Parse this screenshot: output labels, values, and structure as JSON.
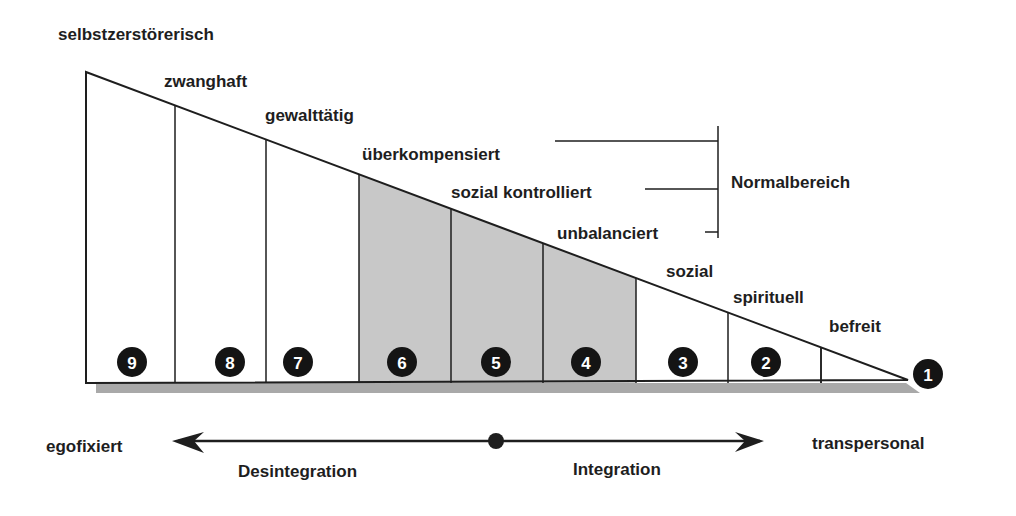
{
  "diagram": {
    "stage_labels": [
      {
        "level": 9,
        "text": "selbstzerstörerisch"
      },
      {
        "level": 8,
        "text": "zwanghaft"
      },
      {
        "level": 7,
        "text": "gewalttätig"
      },
      {
        "level": 6,
        "text": "überkompensiert"
      },
      {
        "level": 5,
        "text": "sozial kontrolliert"
      },
      {
        "level": 4,
        "text": "unbalanciert"
      },
      {
        "level": 3,
        "text": "sozial"
      },
      {
        "level": 2,
        "text": "spirituell"
      },
      {
        "level": 1,
        "text": "befreit"
      }
    ],
    "levels": [
      {
        "number": "9",
        "shaded": false
      },
      {
        "number": "8",
        "shaded": false
      },
      {
        "number": "7",
        "shaded": false
      },
      {
        "number": "6",
        "shaded": true
      },
      {
        "number": "5",
        "shaded": true
      },
      {
        "number": "4",
        "shaded": true
      },
      {
        "number": "3",
        "shaded": false
      },
      {
        "number": "2",
        "shaded": false
      },
      {
        "number": "1",
        "shaded": false
      }
    ],
    "bracket_label": "Normalbereich",
    "axis": {
      "left_label": "egofixiert",
      "right_label": "transpersonal",
      "left_arrow_label": "Desintegration",
      "right_arrow_label": "Integration"
    },
    "colors": {
      "shade": "#c8c8c8",
      "shadow": "#a9a9a9",
      "line": "#1e1e1e",
      "badge": "#141414"
    }
  }
}
